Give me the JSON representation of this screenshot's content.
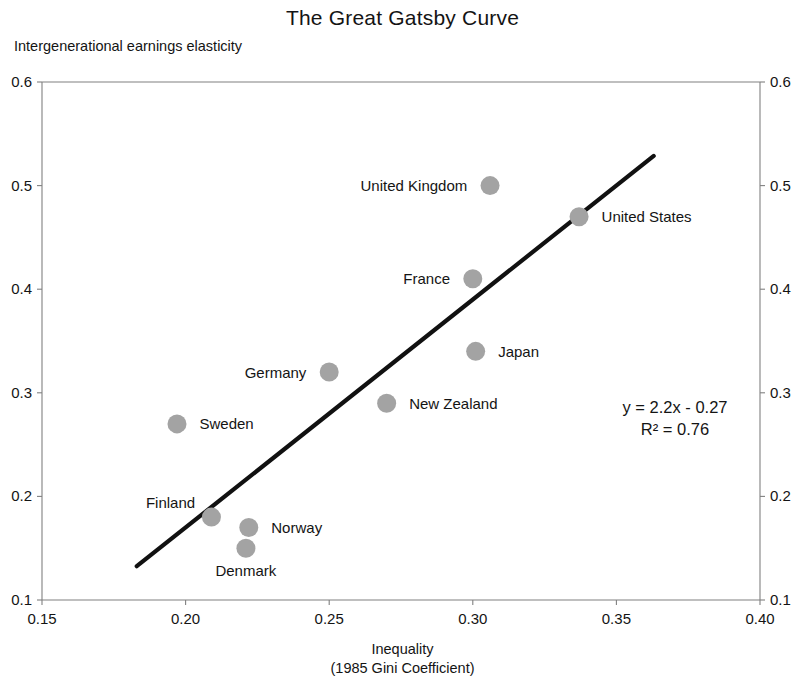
{
  "chart_data": {
    "type": "scatter",
    "title": "The Great Gatsby Curve",
    "xlabel": "Inequality",
    "xlabel_sub": "(1985 Gini Coefficient)",
    "ylabel": "Intergenerational earnings elasticity",
    "xlim": [
      0.15,
      0.4
    ],
    "ylim": [
      0.1,
      0.6
    ],
    "xticks": [
      "0.15",
      "0.20",
      "0.25",
      "0.30",
      "0.35",
      "0.40"
    ],
    "xtick_values": [
      0.15,
      0.2,
      0.25,
      0.3,
      0.35,
      0.4
    ],
    "yticks": [
      "0.1",
      "0.2",
      "0.3",
      "0.4",
      "0.5",
      "0.6"
    ],
    "ytick_values": [
      0.1,
      0.2,
      0.3,
      0.4,
      0.5,
      0.6
    ],
    "grid": false,
    "legend": "none",
    "marker_color": "#a3a3a3",
    "trendline_color": "#111111",
    "axis_color": "#808080",
    "points": [
      {
        "name": "Denmark",
        "x": 0.221,
        "y": 0.15,
        "label_pos": "below"
      },
      {
        "name": "Norway",
        "x": 0.222,
        "y": 0.17,
        "label_pos": "right"
      },
      {
        "name": "Finland",
        "x": 0.209,
        "y": 0.18,
        "label_pos": "upper-left"
      },
      {
        "name": "Sweden",
        "x": 0.197,
        "y": 0.27,
        "label_pos": "right"
      },
      {
        "name": "New Zealand",
        "x": 0.27,
        "y": 0.29,
        "label_pos": "right"
      },
      {
        "name": "Germany",
        "x": 0.25,
        "y": 0.32,
        "label_pos": "left"
      },
      {
        "name": "Japan",
        "x": 0.301,
        "y": 0.34,
        "label_pos": "right"
      },
      {
        "name": "France",
        "x": 0.3,
        "y": 0.41,
        "label_pos": "left"
      },
      {
        "name": "United Kingdom",
        "x": 0.306,
        "y": 0.5,
        "label_pos": "left"
      },
      {
        "name": "United States",
        "x": 0.337,
        "y": 0.47,
        "label_pos": "right"
      }
    ],
    "trendline": {
      "equation": "y = 2.2x - 0.27",
      "r_squared": "R² = 0.76",
      "slope": 2.2,
      "intercept": -0.27,
      "x_start": 0.183,
      "x_end": 0.363
    }
  }
}
